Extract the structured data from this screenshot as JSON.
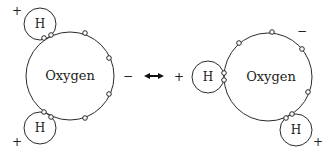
{
  "diagram": {
    "left_molecule": {
      "oxygen_label": "Oxygen",
      "hydrogen_top_label": "H",
      "hydrogen_bottom_label": "H",
      "charge_top_h": "+",
      "charge_bottom_h": "+",
      "charge_oxygen": "−"
    },
    "connector": {
      "symbol": "double-headed-arrow"
    },
    "right_molecule": {
      "oxygen_label": "Oxygen",
      "hydrogen_left_label": "H",
      "hydrogen_bottom_label": "H",
      "charge_left_h": "+",
      "charge_bottom_h": "+",
      "charge_oxygen": "−"
    },
    "colors": {
      "stroke": "#2a2a2a",
      "background": "#ffffff"
    }
  }
}
